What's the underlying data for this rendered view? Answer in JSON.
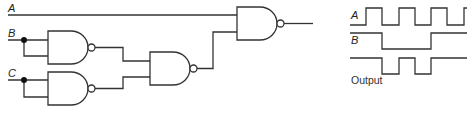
{
  "circuit": {
    "inputs": [
      {
        "label": "A"
      },
      {
        "label": "B"
      },
      {
        "label": "C"
      }
    ],
    "gates": [
      {
        "id": "gate-1",
        "type": "NAND",
        "inputs": [
          "B",
          "B"
        ]
      },
      {
        "id": "gate-2",
        "type": "NAND",
        "inputs": [
          "C",
          "C"
        ]
      },
      {
        "id": "gate-3",
        "type": "NAND",
        "inputs": [
          "gate-1",
          "gate-2"
        ]
      },
      {
        "id": "gate-4",
        "type": "NAND",
        "inputs": [
          "A",
          "gate-3"
        ]
      }
    ]
  },
  "timing": {
    "signals": [
      {
        "label": "A",
        "waveform": [
          0,
          1,
          0,
          1,
          0,
          1,
          0,
          1
        ]
      },
      {
        "label": "B",
        "waveform": [
          1,
          1,
          0,
          0,
          0,
          0,
          1,
          1
        ]
      },
      {
        "label": "Output",
        "waveform": [
          1,
          1,
          0,
          1,
          0,
          1,
          1,
          1
        ]
      }
    ]
  },
  "colors": {
    "line": "#333333",
    "background": "#ffffff"
  }
}
